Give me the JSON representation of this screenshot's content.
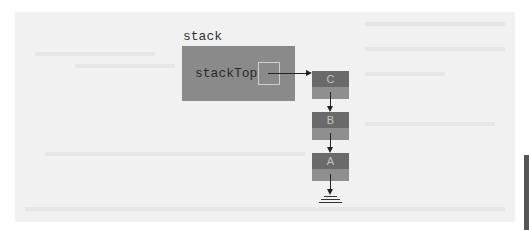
{
  "diagram": {
    "stack_label": "stack",
    "stack_top_label": "stackTop",
    "nodes": [
      {
        "label": "C"
      },
      {
        "label": "B"
      },
      {
        "label": "A"
      }
    ],
    "terminator": "null-ground-icon",
    "colors": {
      "stack_box": "#8a8a8a",
      "node_data": "#6a6a6a",
      "node_next": "#8f8f8f",
      "background": "#f1f1f1"
    }
  }
}
